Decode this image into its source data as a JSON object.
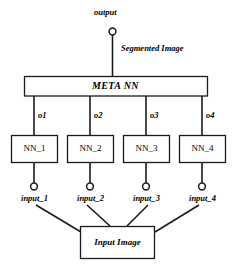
{
  "diagram": {
    "colors": {
      "stroke": "#1a1a1a",
      "background": "#ffffff",
      "text": "#000000"
    },
    "top": {
      "output_label": "output",
      "edge_label": "Segmented Image",
      "output_node_icon": "circle-node-icon"
    },
    "meta": {
      "label": "META NN"
    },
    "outputs": [
      {
        "label": "o1"
      },
      {
        "label": "o2"
      },
      {
        "label": "o3"
      },
      {
        "label": "o4"
      }
    ],
    "networks": [
      {
        "label": "NN_1"
      },
      {
        "label": "NN_2"
      },
      {
        "label": "NN_3"
      },
      {
        "label": "NN_4"
      }
    ],
    "inputs": [
      {
        "label": "input_1",
        "node_icon": "circle-node-icon"
      },
      {
        "label": "input_2",
        "node_icon": "circle-node-icon"
      },
      {
        "label": "input_3",
        "node_icon": "circle-node-icon"
      },
      {
        "label": "input_4",
        "node_icon": "circle-node-icon"
      }
    ],
    "source": {
      "label": "Input Image"
    }
  }
}
